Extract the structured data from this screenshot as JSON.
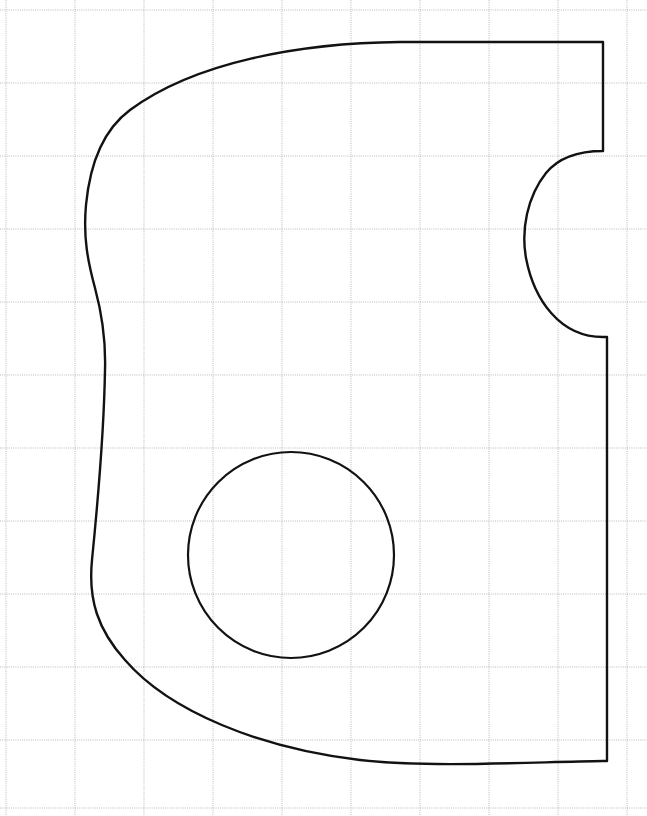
{
  "canvas": {
    "width": 647,
    "height": 816,
    "background_color": "#ffffff",
    "title": "technical-part-outline-on-grid"
  },
  "grid": {
    "label": "graph-paper-grid",
    "line_color": "#a8a8a8",
    "line_width": 0.8,
    "dash_pattern": "1 1.2",
    "vertical_lines_x": [
      6,
      75,
      144,
      213,
      282,
      351,
      420,
      489,
      558,
      627
    ],
    "horizontal_lines_y": [
      10,
      83,
      156,
      229,
      302,
      375,
      448,
      521,
      594,
      667,
      740,
      808
    ],
    "cell_width": 69,
    "cell_height": 73
  },
  "outline": {
    "label": "part-outer-profile",
    "stroke_color": "#121212",
    "stroke_width": 2.4,
    "fill": "none",
    "path": "M 603 42 L 400 42 C 300 43 195 62 130 110 C 103 130 90 163 86 205 C 83 238 88 262 95 288 C 102 314 106 338 105 370 C 104 430 98 500 92 560 C 88 600 98 630 125 660 C 170 712 260 748 360 760 C 430 768 530 762 603 761 L 607 761 L 607 337 L 603 337 C 560 337 534 300 526 258 C 521 230 527 197 546 173 C 560 156 580 151 603 151 L 603 42 Z",
    "segments": [
      {
        "name": "top-edge",
        "type": "near-horizontal-curve",
        "from": [
          603,
          42
        ],
        "to": [
          130,
          110
        ]
      },
      {
        "name": "left-edge-s-curve",
        "type": "s-curve",
        "from": [
          130,
          110
        ],
        "to": [
          92,
          560
        ]
      },
      {
        "name": "bottom-left-sweep",
        "type": "arc",
        "from": [
          92,
          560
        ],
        "to": [
          360,
          760
        ]
      },
      {
        "name": "bottom-edge",
        "type": "near-horizontal",
        "from": [
          360,
          760
        ],
        "to": [
          607,
          761
        ]
      },
      {
        "name": "right-edge-lower",
        "type": "vertical",
        "from": [
          607,
          761
        ],
        "to": [
          607,
          337
        ]
      },
      {
        "name": "notch-semicircle",
        "type": "concave-arc",
        "from": [
          603,
          337
        ],
        "to": [
          603,
          151
        ]
      },
      {
        "name": "right-edge-upper",
        "type": "vertical",
        "from": [
          603,
          151
        ],
        "to": [
          603,
          42
        ]
      }
    ]
  },
  "notch": {
    "label": "right-side-semicircular-cutout",
    "apex_x": 524,
    "top_y": 151,
    "bottom_y": 337,
    "center": [
      603,
      244
    ],
    "radius": 93
  },
  "hole": {
    "label": "center-through-hole",
    "shape": "circle",
    "center_x": 291,
    "center_y": 555,
    "radius": 103,
    "stroke_color": "#121212",
    "stroke_width": 2.2,
    "fill": "none"
  }
}
